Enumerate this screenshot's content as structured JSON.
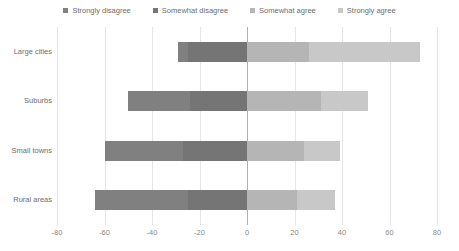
{
  "chart_data": {
    "type": "bar",
    "subtype": "diverging-stacked-bar",
    "orientation": "horizontal",
    "title": "",
    "xlabel": "",
    "ylabel": "",
    "xlim": [
      -80,
      80
    ],
    "xticks": [
      -80,
      -60,
      -40,
      -20,
      0,
      20,
      40,
      60,
      80
    ],
    "xticklabels": [
      "-80",
      "-60",
      "-40",
      "-20",
      "0",
      "20",
      "40",
      "60",
      "80"
    ],
    "grid": true,
    "grid_axis": "x",
    "legend_position": "top-center",
    "categories": [
      "Large cities",
      "Suburbs",
      "Small towns",
      "Rural areas"
    ],
    "series": [
      {
        "name": "Strongly disagree",
        "color": "#808080",
        "values": [
          -4,
          -26,
          -33,
          -39
        ]
      },
      {
        "name": "Somewhat disagree",
        "color": "#757575",
        "values": [
          -25,
          -24,
          -27,
          -25
        ]
      },
      {
        "name": "Somewhat agree",
        "color": "#b5b5b5",
        "values": [
          26,
          31,
          24,
          21
        ]
      },
      {
        "name": "Strongly agree",
        "color": "#c8c8c8",
        "values": [
          47,
          20,
          15,
          16
        ]
      }
    ],
    "bars": [
      {
        "category": "Large cities",
        "segments": [
          {
            "series": "Strongly disagree",
            "start": -29,
            "end": -25,
            "value": -4,
            "color": "#808080"
          },
          {
            "series": "Somewhat disagree",
            "start": -25,
            "end": 0,
            "value": -25,
            "color": "#757575"
          },
          {
            "series": "Somewhat agree",
            "start": 0,
            "end": 26,
            "value": 26,
            "color": "#b5b5b5"
          },
          {
            "series": "Strongly agree",
            "start": 26,
            "end": 73,
            "value": 47,
            "color": "#c8c8c8"
          }
        ],
        "negative_total": -29,
        "positive_total": 73
      },
      {
        "category": "Suburbs",
        "segments": [
          {
            "series": "Strongly disagree",
            "start": -50,
            "end": -24,
            "value": -26,
            "color": "#808080"
          },
          {
            "series": "Somewhat disagree",
            "start": -24,
            "end": 0,
            "value": -24,
            "color": "#757575"
          },
          {
            "series": "Somewhat agree",
            "start": 0,
            "end": 31,
            "value": 31,
            "color": "#b5b5b5"
          },
          {
            "series": "Strongly agree",
            "start": 31,
            "end": 51,
            "value": 20,
            "color": "#c8c8c8"
          }
        ],
        "negative_total": -50,
        "positive_total": 51
      },
      {
        "category": "Small towns",
        "segments": [
          {
            "series": "Strongly disagree",
            "start": -60,
            "end": -27,
            "value": -33,
            "color": "#808080"
          },
          {
            "series": "Somewhat disagree",
            "start": -27,
            "end": 0,
            "value": -27,
            "color": "#757575"
          },
          {
            "series": "Somewhat agree",
            "start": 0,
            "end": 24,
            "value": 24,
            "color": "#b5b5b5"
          },
          {
            "series": "Strongly agree",
            "start": 24,
            "end": 39,
            "value": 15,
            "color": "#c8c8c8"
          }
        ],
        "negative_total": -60,
        "positive_total": 39
      },
      {
        "category": "Rural areas",
        "segments": [
          {
            "series": "Strongly disagree",
            "start": -64,
            "end": -25,
            "value": -39,
            "color": "#808080"
          },
          {
            "series": "Somewhat disagree",
            "start": -25,
            "end": 0,
            "value": -25,
            "color": "#757575"
          },
          {
            "series": "Somewhat agree",
            "start": 0,
            "end": 21,
            "value": 21,
            "color": "#b5b5b5"
          },
          {
            "series": "Strongly agree",
            "start": 21,
            "end": 37,
            "value": 16,
            "color": "#c8c8c8"
          }
        ],
        "negative_total": -64,
        "positive_total": 37
      }
    ]
  },
  "legend": {
    "items": [
      {
        "label": "Strongly disagree",
        "color": "#808080"
      },
      {
        "label": "Somewhat disagree",
        "color": "#757575"
      },
      {
        "label": "Somewhat agree",
        "color": "#b5b5b5"
      },
      {
        "label": "Strongly agree",
        "color": "#c8c8c8"
      }
    ]
  },
  "axis": {
    "y_labels": [
      "Large cities",
      "Suburbs",
      "Small towns",
      "Rural areas"
    ],
    "x_labels": [
      "-80",
      "-60",
      "-40",
      "-20",
      "0",
      "20",
      "40",
      "60",
      "80"
    ]
  },
  "colors": {
    "gridline": "#e6e6e6",
    "zeroline": "#b0b0b0",
    "text": "#6e6e6e",
    "background": "#ffffff"
  }
}
